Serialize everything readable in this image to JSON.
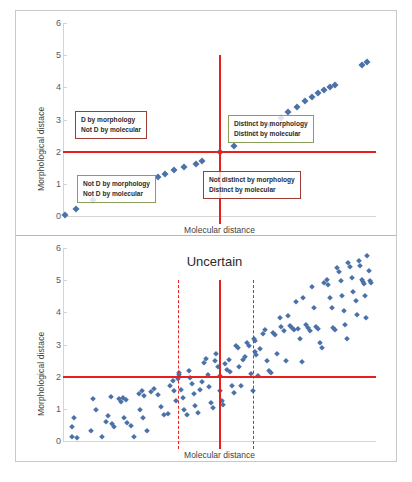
{
  "figure": {
    "caption_partial": "",
    "marker_color": "#4a72a8",
    "threshold_color": "#e8201c",
    "box_red_color": "#9e3b32",
    "box_green_color": "#8aa05a"
  },
  "chart_data": [
    {
      "type": "scatter",
      "panel": "top",
      "title": "",
      "xlabel": "Molecular distance",
      "ylabel": "Morphological distace",
      "xlim": [
        0,
        10
      ],
      "ylim": [
        0,
        6
      ],
      "yticks": [
        0,
        1,
        2,
        3,
        4,
        5,
        6
      ],
      "xticks": [],
      "grid": false,
      "legend": null,
      "thresholds": {
        "horizontal": [
          2
        ],
        "vertical_solid": [
          5
        ],
        "vertical_dashed": []
      },
      "annotations": [
        {
          "id": "top-left",
          "lines": [
            "D by morphology",
            "Not D by molecular"
          ],
          "border": "red",
          "quadrant": "distinct-morphology-not-molecular"
        },
        {
          "id": "top-right",
          "lines": [
            "Distinct by morphology",
            "Distinct by molecular"
          ],
          "border": "green",
          "quadrant": "distinct-both"
        },
        {
          "id": "bottom-left",
          "lines": [
            "Not D by morphology",
            "Not D by molecular"
          ],
          "border": "green",
          "quadrant": "not-distinct-both"
        },
        {
          "id": "bottom-right",
          "lines": [
            "Not distinct by morphology",
            "Distinct by molecular"
          ],
          "border": "red",
          "quadrant": "not-morphology-distinct-molecular"
        }
      ],
      "points": [
        [
          0.05,
          0.02
        ],
        [
          0.42,
          0.22
        ],
        [
          0.95,
          0.5
        ],
        [
          3.05,
          1.22
        ],
        [
          3.25,
          1.3
        ],
        [
          3.55,
          1.42
        ],
        [
          3.85,
          1.52
        ],
        [
          4.25,
          1.62
        ],
        [
          4.45,
          1.7
        ],
        [
          5.0,
          2.0
        ],
        [
          5.45,
          2.18
        ],
        [
          6.1,
          2.58
        ],
        [
          6.62,
          2.82
        ],
        [
          6.95,
          3.05
        ],
        [
          7.2,
          3.22
        ],
        [
          7.48,
          3.4
        ],
        [
          7.72,
          3.58
        ],
        [
          7.95,
          3.7
        ],
        [
          8.15,
          3.82
        ],
        [
          8.35,
          3.92
        ],
        [
          8.52,
          4.02
        ],
        [
          8.68,
          4.08
        ],
        [
          9.55,
          4.68
        ],
        [
          9.72,
          4.78
        ]
      ]
    },
    {
      "type": "scatter",
      "panel": "bottom",
      "title": "Uncertain",
      "xlabel": "Molecular distance",
      "ylabel": "Morphological distace",
      "xlim": [
        0,
        10
      ],
      "ylim": [
        0,
        6
      ],
      "yticks": [
        0,
        1,
        2,
        3,
        4,
        5,
        6
      ],
      "xticks": [],
      "grid": false,
      "legend": null,
      "thresholds": {
        "horizontal": [
          2
        ],
        "vertical_solid": [
          5
        ],
        "vertical_dashed": [
          3.7,
          6.1
        ]
      },
      "annotations": [
        {
          "id": "uncertain",
          "lines": [
            "Uncertain"
          ],
          "border": "none",
          "quadrant": "uncertain-band"
        }
      ],
      "points": [
        [
          0.35,
          0.7
        ],
        [
          0.3,
          0.42
        ],
        [
          0.28,
          0.12
        ],
        [
          0.45,
          0.08
        ],
        [
          0.95,
          1.32
        ],
        [
          1.05,
          0.95
        ],
        [
          0.88,
          0.32
        ],
        [
          1.25,
          0.12
        ],
        [
          1.52,
          1.38
        ],
        [
          1.45,
          0.78
        ],
        [
          1.38,
          0.6
        ],
        [
          1.55,
          0.52
        ],
        [
          1.62,
          0.42
        ],
        [
          1.78,
          1.3
        ],
        [
          1.85,
          1.22
        ],
        [
          1.92,
          1.35
        ],
        [
          2.02,
          1.28
        ],
        [
          1.95,
          0.7
        ],
        [
          2.05,
          0.55
        ],
        [
          2.18,
          0.48
        ],
        [
          2.28,
          0.12
        ],
        [
          2.42,
          1.45
        ],
        [
          2.52,
          1.55
        ],
        [
          2.6,
          1.4
        ],
        [
          2.45,
          0.95
        ],
        [
          2.55,
          0.72
        ],
        [
          2.68,
          0.3
        ],
        [
          2.8,
          1.52
        ],
        [
          2.92,
          1.62
        ],
        [
          3.05,
          1.42
        ],
        [
          3.12,
          1.05
        ],
        [
          3.22,
          0.82
        ],
        [
          3.35,
          0.85
        ],
        [
          3.42,
          1.72
        ],
        [
          3.5,
          1.88
        ],
        [
          3.55,
          1.55
        ],
        [
          3.62,
          1.25
        ],
        [
          3.7,
          2.1
        ],
        [
          3.72,
          2.05
        ],
        [
          3.68,
          1.92
        ],
        [
          3.78,
          1.6
        ],
        [
          3.82,
          1.35
        ],
        [
          3.88,
          0.95
        ],
        [
          3.95,
          0.8
        ],
        [
          4.02,
          2.18
        ],
        [
          4.05,
          1.95
        ],
        [
          4.12,
          1.78
        ],
        [
          4.18,
          1.45
        ],
        [
          4.22,
          1.1
        ],
        [
          4.3,
          0.88
        ],
        [
          4.38,
          1.6
        ],
        [
          4.45,
          1.82
        ],
        [
          4.52,
          2.42
        ],
        [
          4.58,
          2.55
        ],
        [
          4.62,
          2.05
        ],
        [
          4.68,
          1.68
        ],
        [
          4.72,
          1.18
        ],
        [
          4.78,
          1.02
        ],
        [
          4.85,
          2.48
        ],
        [
          4.9,
          2.72
        ],
        [
          4.95,
          2.3
        ],
        [
          5.0,
          2.02
        ],
        [
          5.02,
          1.55
        ],
        [
          5.08,
          1.25
        ],
        [
          5.12,
          1.12
        ],
        [
          5.18,
          2.38
        ],
        [
          5.25,
          2.22
        ],
        [
          5.3,
          2.52
        ],
        [
          5.35,
          2.15
        ],
        [
          5.4,
          1.72
        ],
        [
          5.45,
          1.48
        ],
        [
          5.52,
          2.95
        ],
        [
          5.58,
          2.88
        ],
        [
          5.62,
          2.3
        ],
        [
          5.68,
          1.7
        ],
        [
          5.75,
          2.52
        ],
        [
          5.82,
          2.62
        ],
        [
          5.88,
          3.05
        ],
        [
          5.95,
          2.95
        ],
        [
          6.02,
          2.08
        ],
        [
          6.08,
          1.55
        ],
        [
          6.1,
          3.18
        ],
        [
          6.12,
          3.1
        ],
        [
          6.15,
          2.78
        ],
        [
          6.18,
          2.68
        ],
        [
          6.22,
          2.02
        ],
        [
          6.3,
          2.85
        ],
        [
          6.38,
          3.32
        ],
        [
          6.45,
          3.45
        ],
        [
          6.52,
          2.48
        ],
        [
          6.58,
          2.18
        ],
        [
          6.65,
          2.12
        ],
        [
          6.72,
          3.35
        ],
        [
          6.78,
          3.28
        ],
        [
          6.85,
          2.7
        ],
        [
          6.92,
          3.82
        ],
        [
          6.98,
          3.55
        ],
        [
          7.05,
          3.42
        ],
        [
          7.12,
          2.48
        ],
        [
          7.18,
          3.88
        ],
        [
          7.25,
          3.58
        ],
        [
          7.32,
          3.52
        ],
        [
          7.38,
          3.45
        ],
        [
          7.45,
          4.32
        ],
        [
          7.52,
          3.48
        ],
        [
          7.58,
          3.18
        ],
        [
          7.62,
          2.45
        ],
        [
          7.68,
          4.45
        ],
        [
          7.75,
          3.62
        ],
        [
          7.82,
          3.5
        ],
        [
          7.88,
          3.42
        ],
        [
          7.95,
          4.78
        ],
        [
          8.02,
          4.12
        ],
        [
          8.08,
          3.55
        ],
        [
          8.15,
          3.48
        ],
        [
          8.22,
          3.05
        ],
        [
          8.28,
          2.88
        ],
        [
          8.35,
          4.92
        ],
        [
          8.42,
          5.02
        ],
        [
          8.48,
          4.85
        ],
        [
          8.52,
          4.45
        ],
        [
          8.58,
          4.15
        ],
        [
          8.62,
          3.52
        ],
        [
          8.68,
          3.45
        ],
        [
          8.75,
          5.38
        ],
        [
          8.82,
          5.25
        ],
        [
          8.88,
          4.98
        ],
        [
          8.92,
          4.52
        ],
        [
          8.98,
          4.05
        ],
        [
          9.02,
          3.62
        ],
        [
          9.08,
          3.18
        ],
        [
          9.12,
          5.52
        ],
        [
          9.18,
          5.42
        ],
        [
          9.22,
          5.08
        ],
        [
          9.28,
          4.62
        ],
        [
          9.35,
          4.35
        ],
        [
          9.4,
          3.92
        ],
        [
          9.45,
          5.6
        ],
        [
          9.5,
          5.45
        ],
        [
          9.55,
          5.02
        ],
        [
          9.58,
          4.95
        ],
        [
          9.62,
          4.88
        ],
        [
          9.65,
          4.52
        ],
        [
          9.68,
          3.82
        ],
        [
          9.72,
          5.75
        ],
        [
          9.78,
          5.28
        ],
        [
          9.82,
          4.98
        ],
        [
          9.85,
          4.9
        ]
      ]
    }
  ]
}
